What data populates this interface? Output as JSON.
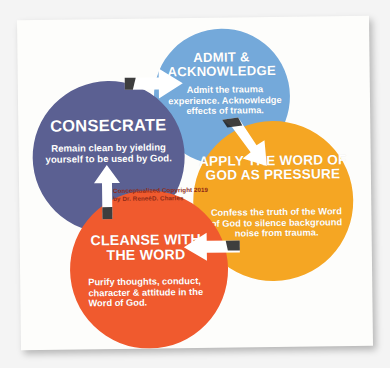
{
  "diagram": {
    "type": "cycle",
    "title_visible": false,
    "background_color": "#f4f4f4",
    "paper_color": "#fdfdfb",
    "steps": [
      {
        "id": "consecrate",
        "title": "CONSECRATE",
        "body": "Remain clean by yielding yourself to be used by God.",
        "color": "#5b6092",
        "order": 1
      },
      {
        "id": "admit",
        "title": "ADMIT & ACKNOWLEDGE",
        "body": "Admit the trauma experience. Acknowledge effects of trauma.",
        "color": "#74a9da",
        "order": 2
      },
      {
        "id": "apply",
        "title": "APPLY  THE WORD OF GOD AS PRESSURE",
        "body": "Confess the truth of the Word of God to silence background noise from trauma.",
        "color": "#f5a623",
        "order": 3
      },
      {
        "id": "cleanse",
        "title": "CLEANSE WITH THE WORD",
        "body": "Purify thoughts, conduct, character & attitude in the Word of God.",
        "color": "#f05a2e",
        "order": 4
      }
    ],
    "arrows": [
      {
        "id": "consecrate-to-admit",
        "icon": "arrow-right-icon",
        "from": "consecrate",
        "to": "admit"
      },
      {
        "id": "admit-to-apply",
        "icon": "arrow-down-right-icon",
        "from": "admit",
        "to": "apply"
      },
      {
        "id": "apply-to-cleanse",
        "icon": "arrow-left-icon",
        "from": "apply",
        "to": "cleanse"
      },
      {
        "id": "cleanse-to-consecrate",
        "icon": "arrow-up-icon",
        "from": "cleanse",
        "to": "consecrate"
      }
    ],
    "credit": {
      "line1": "Conceptualized Copyright 2019",
      "line2": "by Dr. ReneéD. Charles",
      "color": "#8f2b17"
    }
  }
}
